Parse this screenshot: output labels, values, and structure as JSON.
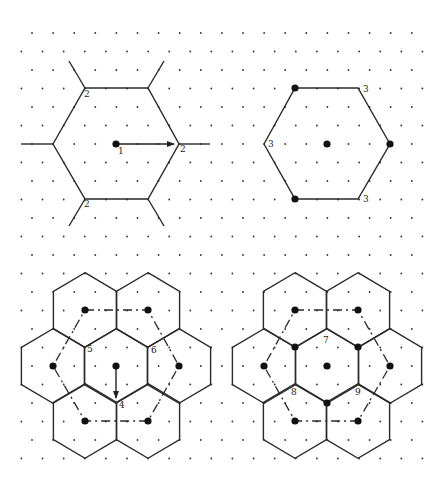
{
  "diagram": {
    "title": "",
    "grid": {
      "color": "#333333",
      "x0": 32,
      "y0": 33,
      "dx": 21.1,
      "dy": 18.5,
      "rows": 24,
      "cols_even": 20,
      "cols_odd": 20,
      "odd_offset_x": -10.55
    },
    "panels": [
      {
        "id": "top-left",
        "description": "Hexagonal Wigner-Seitz cell with first-neighbor translation vector",
        "hexagons": [
          {
            "points": [
              [
                53,
                144
              ],
              [
                85,
                88
              ],
              [
                148,
                88
              ],
              [
                179,
                144
              ],
              [
                148,
                199
              ],
              [
                85,
                199
              ]
            ]
          }
        ],
        "segments": [
          [
            [
              85,
              88
            ],
            [
              69,
              61
            ]
          ],
          [
            [
              148,
              88
            ],
            [
              164,
              61
            ]
          ],
          [
            [
              53,
              144
            ],
            [
              21,
              144
            ]
          ],
          [
            [
              179,
              144
            ],
            [
              210,
              144
            ]
          ],
          [
            [
              85,
              199
            ],
            [
              69,
              226
            ]
          ],
          [
            [
              148,
              199
            ],
            [
              164,
              226
            ]
          ]
        ],
        "big_dots": [
          [
            116,
            144
          ]
        ],
        "arrows": [
          {
            "from": [
              116,
              144
            ],
            "to": [
              174,
              144
            ]
          }
        ],
        "labels": [
          {
            "text": "1",
            "x": 118,
            "y": 154
          },
          {
            "text": "2",
            "x": 84,
            "y": 97
          },
          {
            "text": "2",
            "x": 180,
            "y": 152
          },
          {
            "text": "2",
            "x": 84,
            "y": 207
          }
        ]
      },
      {
        "id": "top-right",
        "description": "Hexagon with alternating vertex occupancy",
        "hexagons": [
          {
            "points": [
              [
                264,
                144
              ],
              [
                295,
                88
              ],
              [
                358,
                88
              ],
              [
                390,
                144
              ],
              [
                358,
                199
              ],
              [
                295,
                199
              ]
            ]
          }
        ],
        "segments": [],
        "big_dots": [
          [
            327,
            144
          ],
          [
            295,
            88
          ],
          [
            390,
            144
          ],
          [
            295,
            199
          ]
        ],
        "arrows": [],
        "labels": [
          {
            "text": "3",
            "x": 363,
            "y": 92
          },
          {
            "text": "3",
            "x": 268,
            "y": 147
          },
          {
            "text": "3",
            "x": 363,
            "y": 202
          }
        ]
      },
      {
        "id": "bottom-left",
        "description": "Seven-cell hexagonal cluster with dash-dot superlattice",
        "hex_center": [
          116,
          366
        ],
        "hex_r": 37.3,
        "hex_centers": [
          [
            116,
            366
          ],
          [
            85,
            310
          ],
          [
            148,
            310
          ],
          [
            53,
            366
          ],
          [
            179,
            366
          ],
          [
            85,
            421
          ],
          [
            148,
            421
          ]
        ],
        "big_dots": [
          [
            116,
            366
          ],
          [
            85,
            310
          ],
          [
            148,
            310
          ],
          [
            53,
            366
          ],
          [
            179,
            366
          ],
          [
            85,
            421
          ],
          [
            148,
            421
          ]
        ],
        "dashed_path": [
          [
            85,
            310
          ],
          [
            148,
            310
          ],
          [
            179,
            366
          ],
          [
            148,
            421
          ],
          [
            85,
            421
          ],
          [
            53,
            366
          ],
          [
            85,
            310
          ]
        ],
        "arrows": [
          {
            "from": [
              116,
              366
            ],
            "to": [
              116,
              398
            ]
          }
        ],
        "labels": [
          {
            "text": "5",
            "x": 87,
            "y": 352
          },
          {
            "text": "6",
            "x": 151,
            "y": 353
          },
          {
            "text": "4",
            "x": 119,
            "y": 408
          }
        ]
      },
      {
        "id": "bottom-right",
        "description": "Seven-cell hexagonal cluster with occupied alternating vertices",
        "hex_center": [
          327,
          366
        ],
        "hex_r": 37.3,
        "hex_centers": [
          [
            327,
            366
          ],
          [
            295,
            310
          ],
          [
            358,
            310
          ],
          [
            264,
            366
          ],
          [
            390,
            366
          ],
          [
            295,
            421
          ],
          [
            358,
            421
          ]
        ],
        "big_dots": [
          [
            327,
            366
          ],
          [
            295,
            310
          ],
          [
            358,
            310
          ],
          [
            264,
            366
          ],
          [
            390,
            366
          ],
          [
            295,
            421
          ],
          [
            358,
            421
          ],
          [
            295,
            347
          ],
          [
            358,
            347
          ],
          [
            327,
            403
          ]
        ],
        "dashed_path": [
          [
            295,
            310
          ],
          [
            358,
            310
          ],
          [
            390,
            366
          ],
          [
            358,
            421
          ],
          [
            295,
            421
          ],
          [
            264,
            366
          ],
          [
            295,
            310
          ]
        ],
        "arrows": [],
        "labels": [
          {
            "text": "7",
            "x": 323,
            "y": 343
          },
          {
            "text": "8",
            "x": 291,
            "y": 395
          },
          {
            "text": "9",
            "x": 355,
            "y": 395
          }
        ]
      }
    ]
  }
}
